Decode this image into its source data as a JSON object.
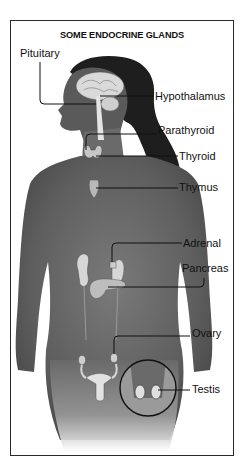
{
  "diagram": {
    "title": "SOME ENDOCRINE GLANDS",
    "labels": {
      "pituitary": "Pituitary",
      "hypothalamus": "Hypothalamus",
      "parathyroid": "Parathyroid",
      "thyroid": "Thyroid",
      "thymus": "Thymus",
      "adrenal": "Adrenal",
      "pancreas": "Pancreas",
      "ovary": "Ovary",
      "testis": "Testis"
    },
    "colors": {
      "frame": "#2a2a2a",
      "skin": "#6e6e6e",
      "hair": "#1e1e1e",
      "organ": "#d8d8d8",
      "leader_line": "#111111"
    }
  }
}
